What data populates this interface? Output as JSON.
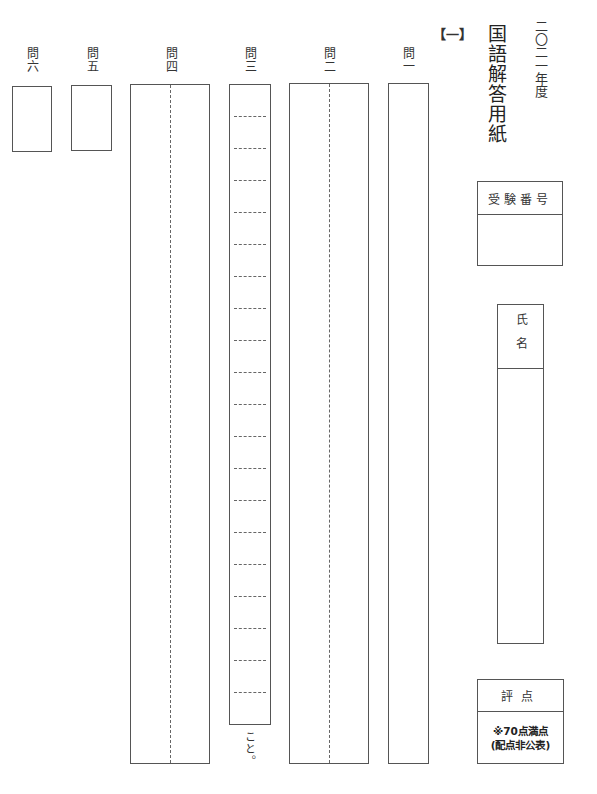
{
  "header": {
    "year": "二〇二一年度",
    "title": "国語解答用紙",
    "section": "【一】"
  },
  "questions": [
    {
      "id": "q1",
      "label": "問一"
    },
    {
      "id": "q2",
      "label": "問二"
    },
    {
      "id": "q3",
      "label": "問三",
      "suffix": "こと。",
      "dashed_rows": 19
    },
    {
      "id": "q4",
      "label": "問四"
    },
    {
      "id": "q5",
      "label": "問五"
    },
    {
      "id": "q6",
      "label": "問六"
    }
  ],
  "exam_number": {
    "label": "受験番号",
    "value": ""
  },
  "name_field": {
    "label": "氏名",
    "value": ""
  },
  "score": {
    "label": "評点",
    "note_line1": "※70点満点",
    "note_line2": "(配点非公表)"
  }
}
